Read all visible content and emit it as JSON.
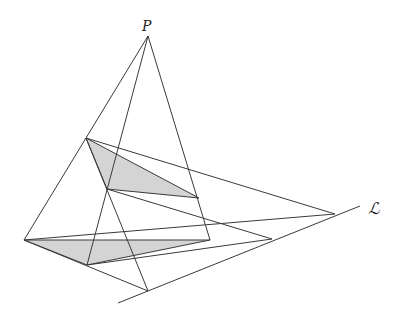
{
  "diagram": {
    "labels": {
      "point": "P",
      "line": "ℒ"
    },
    "colors": {
      "stroke": "#3a3a3a",
      "fill": "#d4d4d4",
      "background": "#ffffff"
    },
    "points": {
      "P": [
        148,
        36
      ],
      "A1": [
        86,
        138
      ],
      "B1": [
        107,
        189
      ],
      "C1": [
        199,
        198
      ],
      "A2": [
        24,
        240
      ],
      "B2": [
        87,
        265
      ],
      "C2": [
        210,
        240
      ],
      "X": [
        335,
        214
      ],
      "Y": [
        272,
        239
      ],
      "Z": [
        148,
        291
      ],
      "L_start": [
        118,
        303
      ],
      "L_end": [
        360,
        206
      ]
    },
    "triangles": [
      {
        "name": "upper-triangle",
        "vertices": [
          "A1",
          "B1",
          "C1"
        ]
      },
      {
        "name": "lower-triangle",
        "vertices": [
          "A2",
          "B2",
          "C2"
        ]
      }
    ],
    "lines": [
      {
        "name": "perspector-line-a",
        "from": "P",
        "to": "A2"
      },
      {
        "name": "perspector-line-b",
        "from": "P",
        "to": "B2"
      },
      {
        "name": "perspector-line-c",
        "from": "P",
        "to": "C2"
      },
      {
        "name": "side-a1-c1-extended",
        "from": "A1",
        "to": "X"
      },
      {
        "name": "side-a2-c2-extended",
        "from": "A2",
        "to": "X"
      },
      {
        "name": "side-b1-c1-extended",
        "from": "B1",
        "to": "Y"
      },
      {
        "name": "side-b2-c2-extended",
        "from": "B2",
        "to": "Y"
      },
      {
        "name": "side-a1-b1-extended",
        "from": "A1",
        "to": "Z"
      },
      {
        "name": "side-a2-b2-extended",
        "from": "A2",
        "to": "Z"
      },
      {
        "name": "axis-line-L",
        "from": "L_start",
        "to": "L_end"
      }
    ]
  }
}
